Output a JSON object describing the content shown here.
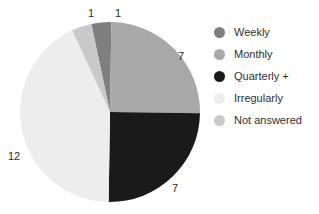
{
  "chart_data": {
    "type": "pie",
    "title": "",
    "total": 28,
    "start_angle_deg": -12,
    "direction": "clockwise",
    "categories": [
      "Weekly",
      "Monthly",
      "Quarterly +",
      "Irregularly",
      "Not answered"
    ],
    "values": [
      1,
      7,
      7,
      12,
      1
    ],
    "colors": [
      "#7f7f7f",
      "#a8a8a8",
      "#1a1a1a",
      "#ededed",
      "#c9c9c9"
    ],
    "legend_position": "right",
    "grid": false,
    "xlabel": "",
    "ylabel": "",
    "slices": [
      {
        "label": "Weekly",
        "value": 1,
        "value_text": "1",
        "color": "#7f7f7f"
      },
      {
        "label": "Monthly",
        "value": 7,
        "value_text": "7",
        "color": "#a8a8a8"
      },
      {
        "label": "Quarterly +",
        "value": 7,
        "value_text": "7",
        "color": "#1a1a1a"
      },
      {
        "label": "Irregularly",
        "value": 12,
        "value_text": "12",
        "color": "#ededed"
      },
      {
        "label": "Not answered",
        "value": 1,
        "value_text": "1",
        "color": "#c9c9c9"
      }
    ],
    "data_labels": {
      "not_answered": "1",
      "weekly": "1",
      "monthly": "7",
      "quarterly": "7",
      "irregularly": "12"
    }
  },
  "legend": {
    "items": [
      {
        "label": "Weekly",
        "color": "#7f7f7f",
        "swatch": "circle-swatch"
      },
      {
        "label": "Monthly",
        "color": "#a8a8a8",
        "swatch": "circle-swatch"
      },
      {
        "label": "Quarterly +",
        "color": "#1a1a1a",
        "swatch": "circle-swatch"
      },
      {
        "label": "Irregularly",
        "color": "#ededed",
        "swatch": "circle-swatch"
      },
      {
        "label": "Not answered",
        "color": "#c9c9c9",
        "swatch": "circle-swatch"
      }
    ]
  }
}
